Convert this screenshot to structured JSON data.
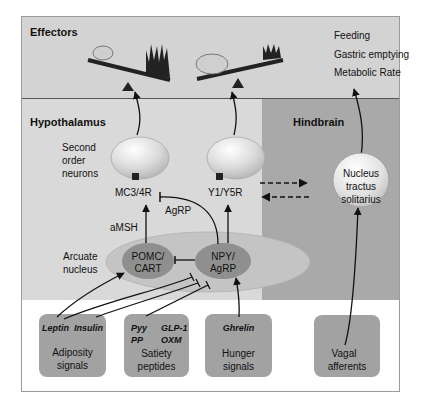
{
  "sections": {
    "effectors": "Effectors",
    "hypothalamus": "Hypothalamus",
    "hindbrain": "Hindbrain"
  },
  "effects": [
    "Feeding",
    "Gastric emptying",
    "Metabolic Rate"
  ],
  "hypothalamus": {
    "second_order_label": [
      "Second",
      "order",
      "neurons"
    ],
    "receptor_left": "MC3/4R",
    "receptor_right": "Y1/Y5R",
    "agrp_label": "AgRP",
    "amsh_label": "aMSH",
    "arcuate_label": [
      "Arcuate",
      "nucleus"
    ],
    "pomc": [
      "POMC/",
      "CART"
    ],
    "npy": [
      "NPY/",
      "AgRP"
    ]
  },
  "hindbrain": {
    "nts": [
      "Nucleus",
      "tractus",
      "solitarius"
    ]
  },
  "signals": [
    {
      "items": [
        "Leptin",
        "Insulin"
      ],
      "label": [
        "Adiposity",
        "signals"
      ]
    },
    {
      "items": [
        "Pyy",
        "GLP-1",
        "PP",
        "OXM"
      ],
      "label": [
        "Satiety",
        "peptides"
      ]
    },
    {
      "items": [
        "Ghrelin"
      ],
      "label": [
        "Hunger",
        "signals"
      ]
    },
    {
      "items": [],
      "label": [
        "Vagal",
        "afferents"
      ]
    }
  ],
  "colors": {
    "effectors_bg": "#d3d3d3",
    "hypothalamus_bg": "#d9d9d9",
    "hindbrain_bg": "#a9a9a9",
    "box_bg": "#a2a2a2",
    "nucleus_dark": "#8f8f8f",
    "arcuate_oval": "#bdbdbd"
  }
}
